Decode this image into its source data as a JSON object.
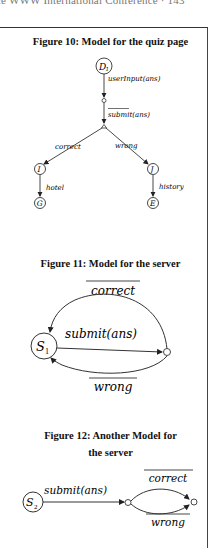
{
  "running_head": "ce WWW International Conference · 143",
  "figures": [
    {
      "caption": "Figure 10: Model for the quiz page",
      "nodes": {
        "root": "D",
        "root_sub": "1",
        "left_mid": "I",
        "right_mid": "J",
        "left_leaf": "G",
        "right_leaf": "E"
      },
      "edges": {
        "user_input": "userInput(ans)",
        "submit": "submit",
        "submit_args": "(ans)",
        "correct": "correct",
        "wrong": "wrong",
        "hotel": "hotel",
        "history": "history"
      }
    },
    {
      "caption": "Figure 11: Model for the server",
      "nodes": {
        "state": "S",
        "state_sub": "1"
      },
      "edges": {
        "correct": "correct",
        "submit": "submit(ans)",
        "wrong": "wrong"
      }
    },
    {
      "caption_line1": "Figure 12: Another Model for",
      "caption_line2": "the server",
      "nodes": {
        "state": "S",
        "state_sub": "2"
      },
      "edges": {
        "submit": "submit(ans)",
        "correct": "correct",
        "wrong": "wrong"
      }
    }
  ]
}
